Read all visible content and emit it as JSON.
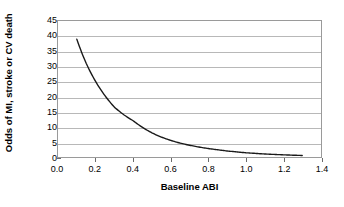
{
  "chart_data": {
    "type": "line",
    "title": "",
    "xlabel": "Baseline ABI",
    "ylabel": "Odds of MI, stroke or CV death",
    "xlim": [
      0.0,
      1.4
    ],
    "ylim": [
      0,
      45
    ],
    "xticks": [
      "0.0",
      "0.2",
      "0.4",
      "0.6",
      "0.8",
      "1.0",
      "1.2",
      "1.4"
    ],
    "xtick_values": [
      0.0,
      0.2,
      0.4,
      0.6,
      0.8,
      1.0,
      1.2,
      1.4
    ],
    "yticks": [
      "0",
      "5",
      "10",
      "15",
      "20",
      "25",
      "30",
      "35",
      "40",
      "45"
    ],
    "ytick_values": [
      0,
      5,
      10,
      15,
      20,
      25,
      30,
      35,
      40,
      45
    ],
    "grid": "horizontal",
    "legend": "none",
    "line_color": "#1a1a1a",
    "grid_color": "#b8b8b8",
    "frame_color": "#9a9a9a",
    "background": "#ffffff",
    "series": [
      {
        "name": "Odds of MI, stroke or CV death",
        "x": [
          0.1,
          0.15,
          0.2,
          0.25,
          0.3,
          0.35,
          0.4,
          0.45,
          0.5,
          0.55,
          0.6,
          0.65,
          0.7,
          0.75,
          0.8,
          0.85,
          0.9,
          0.95,
          1.0,
          1.05,
          1.1,
          1.15,
          1.2,
          1.25,
          1.3
        ],
        "y": [
          39.0,
          31.0,
          25.0,
          20.3,
          16.5,
          14.0,
          12.0,
          9.8,
          8.0,
          6.6,
          5.5,
          4.6,
          3.9,
          3.3,
          2.8,
          2.4,
          2.0,
          1.7,
          1.4,
          1.2,
          1.0,
          0.85,
          0.72,
          0.6,
          0.5
        ]
      }
    ]
  }
}
